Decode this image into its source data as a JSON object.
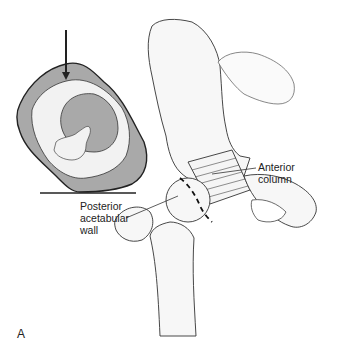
{
  "figure": {
    "panel_letter": "A",
    "labels": {
      "anterior_column_line1": "Anterior",
      "anterior_column_line2": "column",
      "posterior_wall_line1": "Posterior",
      "posterior_wall_line2": "acetabular",
      "posterior_wall_line3": "wall"
    },
    "colors": {
      "inset_fill": "#a9a9a9",
      "bone_fill": "#f7f7f7",
      "line": "#2a2a2a"
    }
  }
}
